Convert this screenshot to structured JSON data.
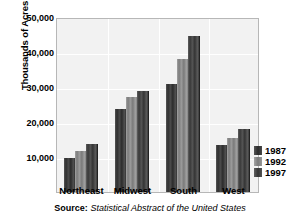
{
  "chart_data": {
    "type": "bar",
    "title": "",
    "xlabel": "",
    "ylabel": "Thousands of Acres",
    "ylim": [
      0,
      50000
    ],
    "ytick_labels": [
      "50,000",
      "40,000",
      "30,000",
      "20,000",
      "10,000"
    ],
    "ytick_values": [
      50000,
      40000,
      30000,
      20000,
      10000
    ],
    "grid": true,
    "legend_position": "right",
    "categories": [
      "Northeast",
      "Midwest",
      "South",
      "West"
    ],
    "series": [
      {
        "name": "1987",
        "color": "#3b3b3b",
        "values": [
          9800,
          23800,
          30800,
          13500
        ]
      },
      {
        "name": "1992",
        "color": "#8b8b8b",
        "values": [
          11700,
          27100,
          37900,
          15500
        ]
      },
      {
        "name": "1997",
        "color": "#454545",
        "values": [
          13800,
          29000,
          44500,
          18100
        ]
      }
    ]
  },
  "legend": {
    "items": [
      {
        "label": "1987"
      },
      {
        "label": "1992"
      },
      {
        "label": "1997"
      }
    ]
  },
  "source": {
    "label": "Source:",
    "text": "Statistical Abstract of the United States"
  },
  "colors": {
    "plot_background": "#f2f2f2",
    "gridline": "#ffffff",
    "plot_border": "#b7b7b7",
    "text": "#000000"
  }
}
